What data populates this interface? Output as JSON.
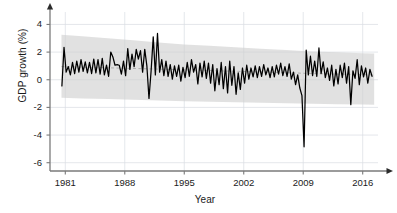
{
  "chart_data": {
    "type": "line",
    "title": "",
    "subtitle": "",
    "xlabel": "Year",
    "ylabel": "GDP growth (%)",
    "xlim": [
      1979.2,
      2017.8
    ],
    "ylim": [
      -6.6,
      4.9
    ],
    "xticks": [
      1981,
      1988,
      1995,
      2002,
      2009,
      2016
    ],
    "xtick_labels": [
      "1981",
      "1988",
      "1995",
      "2002",
      "2009",
      "2016"
    ],
    "yticks": [
      4,
      2,
      0,
      -2,
      -4,
      -6
    ],
    "ytick_labels": [
      "4",
      "2",
      "0",
      "-2",
      "-4",
      "-6"
    ],
    "grid": true,
    "grid_color": "#d9dde2",
    "legend": "none",
    "line_color": "#000000",
    "band_color": "#cfcfcf",
    "mean_line_color": "#8a8a8a",
    "axis_color": "#7a7a7a",
    "annotations": [
      {
        "text": "deep trough at 2009 Q1",
        "x": 2009.0,
        "y": -4.85
      }
    ],
    "series": [
      {
        "name": "GDP growth (%)",
        "kind": "line",
        "x": [
          1980.6,
          1980.85,
          1981.1,
          1981.35,
          1981.6,
          1981.85,
          1982.1,
          1982.35,
          1982.6,
          1982.85,
          1983.1,
          1983.35,
          1983.6,
          1983.85,
          1984.1,
          1984.35,
          1984.6,
          1984.85,
          1985.1,
          1985.35,
          1985.6,
          1985.85,
          1986.1,
          1986.35,
          1986.6,
          1986.85,
          1987.1,
          1987.35,
          1987.6,
          1987.85,
          1988.1,
          1988.35,
          1988.6,
          1988.85,
          1989.1,
          1989.35,
          1989.6,
          1989.85,
          1990.1,
          1990.35,
          1990.6,
          1990.85,
          1991.1,
          1991.35,
          1991.6,
          1991.85,
          1992.1,
          1992.35,
          1992.6,
          1992.85,
          1993.1,
          1993.35,
          1993.6,
          1993.85,
          1994.1,
          1994.35,
          1994.6,
          1994.85,
          1995.1,
          1995.35,
          1995.6,
          1995.85,
          1996.1,
          1996.35,
          1996.6,
          1996.85,
          1997.1,
          1997.35,
          1997.6,
          1997.85,
          1998.1,
          1998.35,
          1998.6,
          1998.85,
          1999.1,
          1999.35,
          1999.6,
          1999.85,
          2000.1,
          2000.35,
          2000.6,
          2000.85,
          2001.1,
          2001.35,
          2001.6,
          2001.85,
          2002.1,
          2002.35,
          2002.6,
          2002.85,
          2003.1,
          2003.35,
          2003.6,
          2003.85,
          2004.1,
          2004.35,
          2004.6,
          2004.85,
          2005.1,
          2005.35,
          2005.6,
          2005.85,
          2006.1,
          2006.35,
          2006.6,
          2006.85,
          2007.1,
          2007.35,
          2007.6,
          2007.85,
          2008.1,
          2008.35,
          2008.6,
          2008.85,
          2009.1,
          2009.35,
          2009.6,
          2009.85,
          2010.1,
          2010.35,
          2010.6,
          2010.85,
          2011.1,
          2011.35,
          2011.6,
          2011.85,
          2012.1,
          2012.35,
          2012.6,
          2012.85,
          2013.1,
          2013.35,
          2013.6,
          2013.85,
          2014.1,
          2014.35,
          2014.6,
          2014.85,
          2015.1,
          2015.35,
          2015.6,
          2015.85,
          2016.1,
          2016.35,
          2016.6,
          2016.85,
          2017.1
        ],
        "y": [
          -0.45,
          2.35,
          0.55,
          0.95,
          0.35,
          1.25,
          0.45,
          1.35,
          0.55,
          1.45,
          0.6,
          1.3,
          0.5,
          1.25,
          0.45,
          1.5,
          0.5,
          1.45,
          0.4,
          1.55,
          0.35,
          1.05,
          0.25,
          2.0,
          1.65,
          1.05,
          1.1,
          1.05,
          0.4,
          1.35,
          0.3,
          2.25,
          0.75,
          1.85,
          0.95,
          2.2,
          1.5,
          2.1,
          0.55,
          2.2,
          1.0,
          -1.35,
          0.65,
          3.1,
          0.35,
          3.35,
          0.55,
          1.45,
          0.3,
          1.35,
          0.25,
          1.1,
          0.05,
          1.0,
          0.25,
          1.05,
          -0.1,
          0.9,
          0.15,
          1.25,
          0.25,
          1.45,
          0.55,
          1.1,
          -0.3,
          1.2,
          0.2,
          1.35,
          0.1,
          1.2,
          -0.25,
          1.1,
          -0.8,
          0.8,
          -0.35,
          1.25,
          -0.65,
          0.95,
          -0.95,
          1.35,
          -0.4,
          0.95,
          -1.05,
          0.5,
          -0.7,
          0.85,
          -0.25,
          1.05,
          0.05,
          0.85,
          0.2,
          1.0,
          0.15,
          0.95,
          0.25,
          1.1,
          0.35,
          0.85,
          0.15,
          0.95,
          0.2,
          1.05,
          0.4,
          1.2,
          0.3,
          0.95,
          0.25,
          1.15,
          0.05,
          0.55,
          -0.35,
          0.35,
          -0.6,
          -1.15,
          -4.85,
          2.15,
          0.35,
          1.7,
          0.3,
          1.35,
          0.25,
          2.3,
          0.45,
          1.3,
          0.15,
          0.85,
          -0.05,
          1.05,
          -0.45,
          0.75,
          -0.3,
          1.05,
          0.15,
          1.2,
          -0.25,
          0.95,
          -1.8,
          0.65,
          0.1,
          1.45,
          -0.35,
          1.0,
          0.2,
          0.85,
          -0.25,
          0.75,
          0.25
        ]
      },
      {
        "name": "confidence band upper",
        "kind": "band_upper",
        "x": [
          1980.55,
          1983,
          1986,
          1989,
          1992,
          1995,
          1998,
          2001,
          2004,
          2007,
          2010,
          2013,
          2016,
          2017.35
        ],
        "y": [
          3.25,
          3.15,
          3.0,
          2.85,
          2.7,
          2.55,
          2.45,
          2.35,
          2.25,
          2.15,
          2.05,
          1.98,
          1.92,
          1.9
        ]
      },
      {
        "name": "confidence band lower",
        "kind": "band_lower",
        "x": [
          1980.55,
          1983,
          1986,
          1989,
          1992,
          1995,
          1998,
          2001,
          2004,
          2007,
          2010,
          2013,
          2016,
          2017.35
        ],
        "y": [
          -1.3,
          -1.35,
          -1.4,
          -1.45,
          -1.5,
          -1.55,
          -1.6,
          -1.63,
          -1.67,
          -1.7,
          -1.74,
          -1.77,
          -1.79,
          -1.8
        ]
      },
      {
        "name": "mean trend",
        "kind": "dashed_mean",
        "x": [
          1980.55,
          1985,
          1990,
          1995,
          2000,
          2005,
          2010,
          2015,
          2017.35
        ],
        "y": [
          0.95,
          0.88,
          0.8,
          0.72,
          0.63,
          0.55,
          0.45,
          0.38,
          0.35
        ]
      }
    ]
  }
}
